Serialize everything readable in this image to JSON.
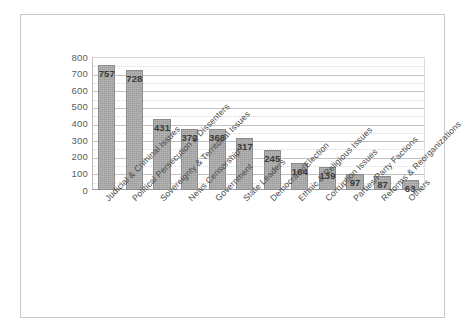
{
  "chart_data": {
    "type": "bar",
    "title": "",
    "subtitle": "",
    "xlabel": "",
    "ylabel": "",
    "ylim": [
      0,
      800
    ],
    "ytick_step": 100,
    "yticks": [
      "800",
      "700",
      "600",
      "500",
      "400",
      "300",
      "200",
      "100",
      "0"
    ],
    "grid": true,
    "legend": "none",
    "orientation": "vertical",
    "bar_color": "#9d9d9d",
    "categories": [
      "Judicial & Criminal Issues",
      "Political Persecution & Dissenters",
      "Sovereignty & Territorial Issues",
      "News Censorship",
      "Government",
      "State Leaders",
      "Democracy/Election",
      "Ethnic & Religious Issues",
      "Corruption Issues",
      "Parties/Party Factions",
      "Reforms & Reorganizations",
      "Others"
    ],
    "values": [
      757,
      728,
      431,
      372,
      368,
      317,
      245,
      164,
      139,
      97,
      87,
      63
    ],
    "data_labels": [
      "757",
      "728",
      "431",
      "372",
      "368",
      "317",
      "245",
      "164",
      "139",
      "97",
      "87",
      "63"
    ]
  },
  "figure": {
    "frame_color": "#c9c9c9",
    "background": "#ffffff"
  }
}
